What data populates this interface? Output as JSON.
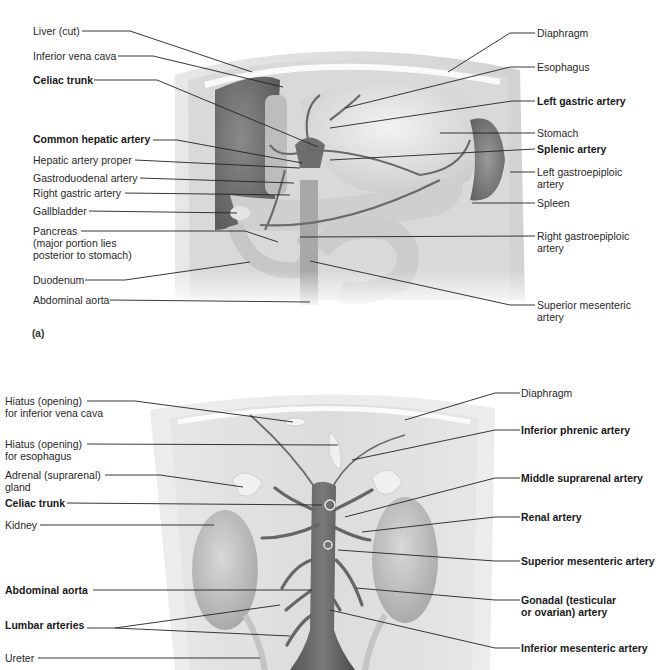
{
  "figure_a": {
    "panel_label": "(a)",
    "left_labels": [
      {
        "text": "Liver (cut)",
        "bold": false
      },
      {
        "text": "Inferior vena cava",
        "bold": false
      },
      {
        "text": "Celiac trunk",
        "bold": true
      },
      {
        "text": "Common hepatic artery",
        "bold": true
      },
      {
        "text": "Hepatic artery proper",
        "bold": false
      },
      {
        "text": "Gastroduodenal artery",
        "bold": false
      },
      {
        "text": "Right gastric artery",
        "bold": false
      },
      {
        "text": "Gallbladder",
        "bold": false
      },
      {
        "text": "Pancreas\n(major portion lies\nposterior to stomach)",
        "bold": false
      },
      {
        "text": "Duodenum",
        "bold": false
      },
      {
        "text": "Abdominal aorta",
        "bold": false
      }
    ],
    "right_labels": [
      {
        "text": "Diaphragm",
        "bold": false
      },
      {
        "text": "Esophagus",
        "bold": false
      },
      {
        "text": "Left gastric artery",
        "bold": true
      },
      {
        "text": "Stomach",
        "bold": false
      },
      {
        "text": "Splenic artery",
        "bold": true
      },
      {
        "text": "Left gastroepiploic\nartery",
        "bold": false
      },
      {
        "text": "Spleen",
        "bold": false
      },
      {
        "text": "Right gastroepiploic\nartery",
        "bold": false
      },
      {
        "text": "Superior mesenteric\nartery",
        "bold": false
      }
    ]
  },
  "figure_b": {
    "left_labels": [
      {
        "text": "Hiatus (opening)\nfor inferior vena cava",
        "bold": false
      },
      {
        "text": "Hiatus (opening)\nfor esophagus",
        "bold": false
      },
      {
        "text": "Adrenal (suprarenal)\ngland",
        "bold": false
      },
      {
        "text": "Celiac trunk",
        "bold": true
      },
      {
        "text": "Kidney",
        "bold": false
      },
      {
        "text": "Abdominal aorta",
        "bold": true
      },
      {
        "text": "Lumbar arteries",
        "bold": true
      },
      {
        "text": "Ureter",
        "bold": false
      }
    ],
    "right_labels": [
      {
        "text": "Diaphragm",
        "bold": false
      },
      {
        "text": "Inferior phrenic artery",
        "bold": true
      },
      {
        "text": "Middle suprarenal artery",
        "bold": true
      },
      {
        "text": "Renal artery",
        "bold": true
      },
      {
        "text": "Superior mesenteric artery",
        "bold": true
      },
      {
        "text": "Gonadal (testicular\nor ovarian) artery",
        "bold": true
      },
      {
        "text": "Inferior mesenteric artery",
        "bold": true
      }
    ]
  }
}
